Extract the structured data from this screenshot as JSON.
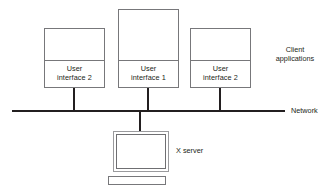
{
  "diagram": {
    "colors": {
      "line": "#231f20",
      "box_border": "#77777a",
      "monitor_frame": "#9a9a9d",
      "text": "#231f20",
      "background": "#ffffff"
    },
    "clients": [
      {
        "id": "user-interface-2-left",
        "label_line1": "User",
        "label_line2": "interface 2"
      },
      {
        "id": "user-interface-1-center",
        "label_line1": "User",
        "label_line2": "interface 1"
      },
      {
        "id": "user-interface-2-right",
        "label_line1": "User",
        "label_line2": "interface 2"
      }
    ],
    "client_group_label": {
      "line1": "Client",
      "line2": "applications"
    },
    "network_label": "Network",
    "server_label": "X server"
  }
}
